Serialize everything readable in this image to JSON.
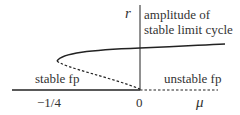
{
  "diagram": {
    "type": "bifurcation-diagram",
    "axis_y_label": "r",
    "axis_x_label": "μ",
    "tick_neg": "−1/4",
    "tick_zero": "0",
    "label_upper": "amplitude of",
    "label_upper_2": "stable limit cycle",
    "label_stable": "stable fp",
    "label_unstable": "unstable fp",
    "colors": {
      "line": "#222222",
      "background": "#ffffff"
    }
  }
}
